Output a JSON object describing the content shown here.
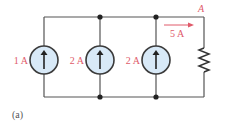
{
  "diagram": {
    "type": "circuit",
    "caption": "(a)",
    "node_label": "A",
    "current_arrow_label": "5 A",
    "sources": [
      {
        "label": "1 A",
        "direction": "up"
      },
      {
        "label": "2 A",
        "direction": "up"
      },
      {
        "label": "2 A",
        "direction": "up"
      }
    ],
    "load": "resistor",
    "colors": {
      "label": "#e05a6a",
      "source_fill": "#d8e9f7",
      "wire": "#555555"
    }
  }
}
